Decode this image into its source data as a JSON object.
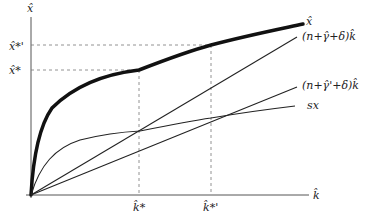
{
  "diagram": {
    "axes": {
      "y_label": "x̂",
      "x_label": "k̂"
    },
    "y_ticks": [
      {
        "label": "x̂*'",
        "y": 45
      },
      {
        "label": "x̂*",
        "y": 70
      }
    ],
    "x_ticks": [
      {
        "label": "k̂*",
        "x": 139
      },
      {
        "label": "k̂*'",
        "x": 211
      }
    ],
    "curves": [
      {
        "name": "output",
        "label": "x̂",
        "style": "thick"
      },
      {
        "name": "break-even-high",
        "label": "(n+γ̂+δ)k̂",
        "style": "thin"
      },
      {
        "name": "break-even-low",
        "label": "(n+γ̂'+δ)k̂",
        "style": "thin"
      },
      {
        "name": "saving",
        "label": "sx",
        "style": "thin"
      }
    ],
    "colors": {
      "line": "#1a1a1a",
      "dashed": "#777777",
      "axis": "#555555"
    }
  }
}
